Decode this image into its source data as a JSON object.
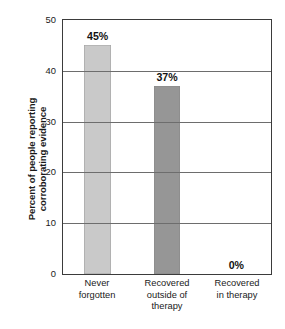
{
  "chart_data": {
    "type": "bar",
    "title": "",
    "xlabel": "",
    "ylabel_lines": [
      "Percent of people reporting",
      "corroborating evidence"
    ],
    "ylabel": "Percent of people reporting corroborating evidence",
    "categories": [
      "Never forgotten",
      "Recovered outside of therapy",
      "Recovered in therapy"
    ],
    "category_lines": [
      [
        "Never",
        "forgotten"
      ],
      [
        "Recovered",
        "outside of",
        "therapy"
      ],
      [
        "Recovered",
        "in therapy"
      ]
    ],
    "values": [
      45,
      37,
      0
    ],
    "value_labels": [
      "45%",
      "37%",
      "0%"
    ],
    "bar_colors": [
      "#c9c9c9",
      "#969696",
      "#ffffff"
    ],
    "ylim": [
      0,
      50
    ],
    "yticks": [
      0,
      10,
      20,
      30,
      40,
      50
    ],
    "ytick_labels": [
      "0",
      "10",
      "20",
      "30",
      "40",
      "50"
    ],
    "grid": true,
    "gridlines_at": [
      10,
      20,
      30,
      40
    ],
    "legend": null,
    "legend_position": "none",
    "axis_color": "#3b3b3b",
    "grid_color": "#6d6d6d",
    "background": "#ffffff"
  }
}
